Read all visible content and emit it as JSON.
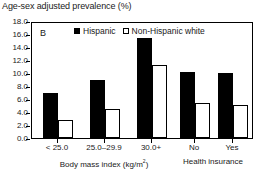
{
  "chart_data": {
    "type": "bar",
    "title": "Age-sex adjusted prevalence (%)",
    "panel_label": "B",
    "xlabel": "",
    "ylabel": "",
    "ylim": [
      0.0,
      18.0
    ],
    "ytick_step": 2.0,
    "grid": false,
    "legend_position": "top-center",
    "ytick_labels": [
      "18.0",
      "16.0",
      "14.0",
      "12.0",
      "10.0",
      "8.0",
      "6.0",
      "4.0",
      "2.0",
      "0.0"
    ],
    "ytick_values": [
      18.0,
      16.0,
      14.0,
      12.0,
      10.0,
      8.0,
      6.0,
      4.0,
      2.0,
      0.0
    ],
    "groups": [
      {
        "axis_title": "Body mass index (kg/m",
        "axis_title_sup": "2",
        "axis_title_tail": ")",
        "categories": [
          "< 25.0",
          "25.0–29.9",
          "30.0+"
        ]
      },
      {
        "axis_title": "Health insurance",
        "axis_title_sup": "",
        "axis_title_tail": "",
        "categories": [
          "No",
          "Yes"
        ]
      }
    ],
    "categories": [
      "< 25.0",
      "25.0–29.9",
      "30.0+",
      "No",
      "Yes"
    ],
    "series": [
      {
        "name": "Hispanic",
        "marker": "filled-square",
        "color": "#000000",
        "values": [
          7.0,
          8.9,
          15.4,
          10.1,
          10.0
        ]
      },
      {
        "name": "Non-Hispanic white",
        "marker": "open-square",
        "color": "#ffffff",
        "values": [
          2.7,
          4.5,
          11.2,
          5.4,
          5.1
        ]
      }
    ]
  }
}
